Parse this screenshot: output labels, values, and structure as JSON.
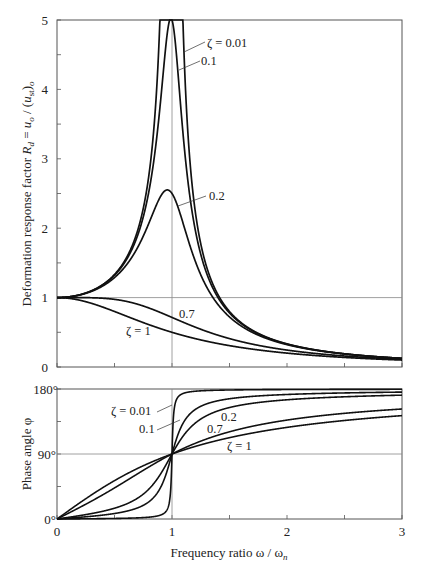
{
  "chart_data": [
    {
      "type": "line",
      "title": "",
      "xlabel": "",
      "ylabel": "Deformation response factor R_d = u_o / (u_st)_o",
      "xlim": [
        0,
        3
      ],
      "ylim": [
        0,
        5
      ],
      "x_ticks": [
        0,
        0.5,
        1,
        1.5,
        2,
        2.5,
        3
      ],
      "y_ticks": [
        "0",
        "1",
        "2",
        "3",
        "4",
        "5"
      ],
      "reference_lines": {
        "x": 1,
        "y": 1
      },
      "formula": "R_d = 1 / sqrt((1 - r^2)^2 + (2*zeta*r)^2)",
      "series": [
        {
          "name": "ζ = 0.01",
          "zeta": 0.01,
          "peak_at_r1": 50
        },
        {
          "name": "0.1",
          "zeta": 0.1,
          "peak_at_r1": 5.0
        },
        {
          "name": "0.2",
          "zeta": 0.2,
          "peak_at_r1": 2.5
        },
        {
          "name": "0.7",
          "zeta": 0.7,
          "peak_at_r1": 0.71
        },
        {
          "name": "ζ = 1",
          "zeta": 1.0,
          "peak_at_r1": 0.5
        }
      ],
      "annotations": [
        {
          "text": "ζ = 0.01",
          "x": 1.32,
          "y": 4.64
        },
        {
          "text": "0.1",
          "x": 1.32,
          "y": 4.37
        },
        {
          "text": "0.2",
          "x": 1.32,
          "y": 2.5
        },
        {
          "text": "0.7",
          "x": 1.06,
          "y": 0.78
        },
        {
          "text": "ζ = 1",
          "x": 0.58,
          "y": 0.55
        }
      ]
    },
    {
      "type": "line",
      "title": "",
      "xlabel": "Frequency ratio ω / ω_n",
      "ylabel": "Phase angle φ",
      "xlim": [
        0,
        3
      ],
      "ylim": [
        0,
        180
      ],
      "x_ticks": [
        "0",
        "1",
        "2",
        "3"
      ],
      "y_ticks": [
        "0°",
        "90°",
        "180°"
      ],
      "reference_lines": {
        "x": 1,
        "y": 90
      },
      "formula": "phi = atan2(2*zeta*r, 1 - r^2) in degrees",
      "series": [
        {
          "name": "ζ = 0.01",
          "zeta": 0.01
        },
        {
          "name": "0.1",
          "zeta": 0.1
        },
        {
          "name": "0.2",
          "zeta": 0.2
        },
        {
          "name": "0.7",
          "zeta": 0.7
        },
        {
          "name": "ζ = 1",
          "zeta": 1.0
        }
      ],
      "annotations": [
        {
          "text": "ζ = 0.01",
          "x": 0.55,
          "y": 138
        },
        {
          "text": "0.1",
          "x": 0.72,
          "y": 117
        },
        {
          "text": "0.2",
          "x": 1.42,
          "y": 135
        },
        {
          "text": "0.7",
          "x": 1.3,
          "y": 116
        },
        {
          "text": "ζ = 1",
          "x": 1.47,
          "y": 95
        }
      ]
    }
  ],
  "top_plot": {
    "y_tick_labels": [
      "0",
      "1",
      "2",
      "3",
      "4",
      "5"
    ],
    "ylabel_prefix": "Deformation response factor ",
    "ylabel_R": "R",
    "ylabel_d": "d",
    "ylabel_eq": " = ",
    "ylabel_u": "u",
    "ylabel_o": "o",
    "ylabel_mid": " / (",
    "ylabel_st": "st",
    "ylabel_close": ")",
    "labels": [
      "ζ = 0.01",
      "0.1",
      "0.2",
      "0.7",
      "ζ = 1"
    ]
  },
  "bottom_plot": {
    "y_tick_labels": [
      "0°",
      "90°",
      "180°"
    ],
    "x_tick_labels": [
      "0",
      "1",
      "2",
      "3"
    ],
    "ylabel": "Phase angle φ",
    "labels": [
      "ζ = 0.01",
      "0.1",
      "0.2",
      "0.7",
      "ζ = 1"
    ]
  },
  "xaxis": {
    "title_main": "Frequency ratio ω / ω",
    "title_sub": "n"
  },
  "colors": {
    "curve": "#111111",
    "frame": "#555555",
    "reference": "#777777"
  }
}
